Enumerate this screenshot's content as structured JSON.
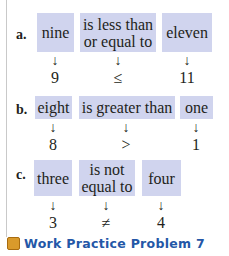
{
  "rows": [
    {
      "label": "a.",
      "words": [
        "nine",
        "is less than or equal to",
        "eleven"
      ],
      "word_lines": [
        [
          "nine"
        ],
        [
          "is less than",
          "or equal to"
        ],
        [
          "eleven"
        ]
      ],
      "symbols": [
        "9",
        "≤",
        "11"
      ]
    },
    {
      "label": "b.",
      "words": [
        "eight",
        "is greater than",
        "one"
      ],
      "symbols": [
        "8",
        ">",
        "1"
      ]
    },
    {
      "label": "c.",
      "words": [
        "three",
        "is not equal to",
        "four"
      ],
      "word_lines": [
        [
          "three"
        ],
        [
          "is not",
          "equal to"
        ],
        [
          "four"
        ]
      ],
      "symbols": [
        "3",
        "≠",
        "4"
      ]
    }
  ],
  "arrow_glyph": "↓",
  "footer": {
    "text": "Work Practice Problem 7",
    "icon_color": "#d99a2b",
    "text_color": "#2457a7"
  },
  "colors": {
    "box_fill": "#d0d4ee"
  }
}
